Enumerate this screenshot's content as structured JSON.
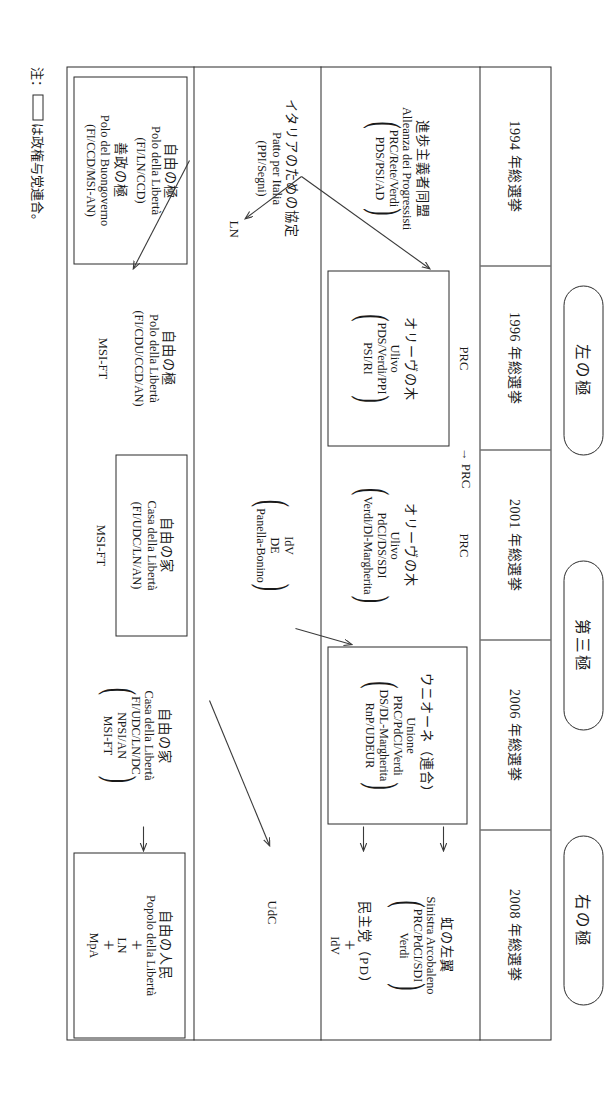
{
  "figure": {
    "poles": [
      {
        "id": "left",
        "label": "左の極"
      },
      {
        "id": "third",
        "label": "第三極"
      },
      {
        "id": "right",
        "label": "右の極"
      }
    ],
    "years": [
      {
        "id": "y1994",
        "label": "1994 年総選挙"
      },
      {
        "id": "y1996",
        "label": "1996 年総選挙"
      },
      {
        "id": "y2001",
        "label": "2001 年総選挙"
      },
      {
        "id": "y2006",
        "label": "2006 年総選挙"
      },
      {
        "id": "y2008",
        "label": "2008 年総選挙"
      }
    ],
    "left_pole": {
      "y1994": {
        "jp": "進歩主義者同盟",
        "it": "Alleanza dei Progressisti",
        "members_line1": "PRC/Rete/Verdi",
        "members_line2": "PDS/PSI/AD"
      },
      "y1996": {
        "outside": "PRC",
        "jp": "オリーヴの木",
        "it": "Ulivo",
        "members_line1": "PDS/Verdi/PPI",
        "members_line2": "PSI/RI"
      },
      "y2001": {
        "outside": "PRC",
        "jp": "オリーヴの木",
        "it": "Ulivo",
        "members_line1": "PdCI/DS/SDI",
        "members_line2": "Verdi/Dl-Margherita"
      },
      "y2006": {
        "jp": "ウニオーネ（連合）",
        "it": "Unione",
        "members_line1": "PRC/PdCI/Verdi",
        "members_line2": "DS/DL-Margherita",
        "members_line3": "RnP/UDEUR"
      },
      "y2008": {
        "jp": "虹の左翼",
        "it": "Sinistra Arcobaleno",
        "members_line1": "PRC/PdCI/SDI",
        "members_line2": "Verdi",
        "pd_line1": "民主党（PD）",
        "pd_plus": "＋",
        "pd_line2": "IdV"
      }
    },
    "third_pole": {
      "y1994": {
        "jp": "イタリアのための協定",
        "it": "Patto per Italia",
        "members": "PPI/Segni"
      },
      "y1994_arrow_label": "LN",
      "y2001": {
        "members_line1": "IdV",
        "members_line2": "DE",
        "members_line3": "Panella-Bonino"
      },
      "y2008": {
        "label": "UdC"
      }
    },
    "right_pole": {
      "y1994": {
        "jp1": "自由の極",
        "it1": "Polo della Libertà",
        "members1": "FI/LN/CCD",
        "jp2": "善政の極",
        "it2": "Polo del Buongoverno",
        "members2": "FI/CCD/MSI-AN"
      },
      "y1996": {
        "jp": "自由の極",
        "it": "Polo della Libertà",
        "members": "FI/CDU/CCD/AN",
        "outside": "MSI-FT"
      },
      "y2001": {
        "jp": "自由の家",
        "it": "Casa della Libertà",
        "members": "FI/UDC/LN/AN",
        "outside": "MSI-FT"
      },
      "y2006": {
        "jp": "自由の家",
        "it": "Casa della Libertà",
        "members_line1": "FI/UDC/LN/DC",
        "members_line2": "NPSI/AN",
        "members_line3": "MSI-FT"
      },
      "y2008": {
        "jp": "自由の人民",
        "it": "Popolo della Libertà",
        "plus1": "＋",
        "add1": "LN",
        "plus2": "＋",
        "add2": "MpA"
      }
    },
    "note": {
      "prefix": "注：",
      "suffix": "は政権与党連合。"
    },
    "arrow_labels": {
      "prc_1996_to_2001": "→ PRC"
    },
    "colors": {
      "ink": "#2b2b2b",
      "paper": "#ffffff",
      "rule": "#3a3a3a"
    }
  }
}
